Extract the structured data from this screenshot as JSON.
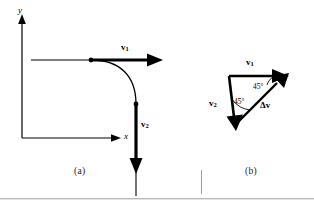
{
  "figure": {
    "type": "physics-vector-diagram",
    "background_color": "#ffffff",
    "line_color": "#000000",
    "panels": [
      {
        "id": "a",
        "caption": "(a)",
        "description": "Particle path turning a corner: velocity v1 horizontal, velocity v2 vertical downward",
        "axes": {
          "y_label": "y",
          "x_label": "x"
        },
        "vectors": [
          {
            "name": "v1",
            "label_main": "v",
            "label_sub": "1",
            "direction": "right"
          },
          {
            "name": "v2",
            "label_main": "v",
            "label_sub": "2",
            "direction": "down"
          }
        ]
      },
      {
        "id": "b",
        "caption": "(b)",
        "description": "Vector triangle showing change in velocity delta-v",
        "vectors": [
          {
            "name": "v1",
            "label_main": "v",
            "label_sub": "1",
            "direction": "right"
          },
          {
            "name": "v2",
            "label_main": "v",
            "label_sub": "2",
            "direction": "down-left"
          },
          {
            "name": "delta-v",
            "label_main": "Δv",
            "label_sub": "",
            "direction": "up-right"
          }
        ],
        "angles": [
          {
            "id": "upper",
            "value": "45°"
          },
          {
            "id": "lower",
            "value": "45°"
          }
        ]
      }
    ]
  },
  "labels": {
    "y_axis": "y",
    "x_axis": "x",
    "v1_a": "v",
    "v1_a_sub": "1",
    "v2_a": "v",
    "v2_a_sub": "2",
    "v1_b": "v",
    "v1_b_sub": "1",
    "v2_b": "v",
    "v2_b_sub": "2",
    "delta_v": "Δv",
    "angle_upper": "45°",
    "angle_lower": "45°",
    "caption_a": "(a)",
    "caption_b": "(b)"
  }
}
